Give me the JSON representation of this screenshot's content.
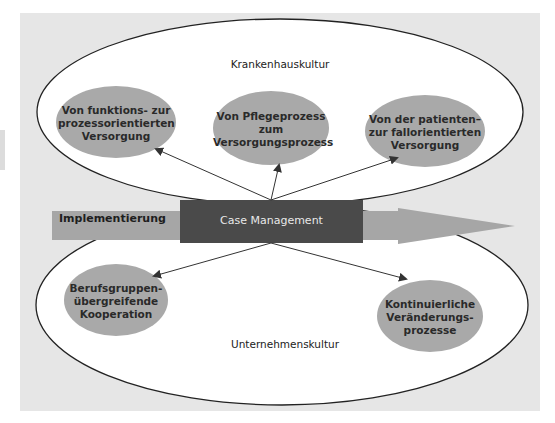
{
  "diagram": {
    "cultures": {
      "top": "Krankenhauskultur",
      "bottom": "Unternehmenskultur"
    },
    "center": {
      "label": "Case Management"
    },
    "flow_arrow": {
      "label": "Implementierung"
    },
    "top_nodes": [
      {
        "lines": [
          "Von funktions- zur",
          "prozessorientierten",
          "Versorgung"
        ]
      },
      {
        "lines": [
          "Von Pflegeprozess",
          "zum",
          "Versorgungsprozess"
        ]
      },
      {
        "lines": [
          "Von der patienten–",
          "zur fallorientierten",
          "Versorgung"
        ]
      }
    ],
    "bottom_nodes": [
      {
        "lines": [
          "Berufsgruppen-",
          "übergreifende",
          "Kooperation"
        ]
      },
      {
        "lines": [
          "Kontinuierliche",
          "Veränderungs-",
          "prozesse"
        ]
      }
    ],
    "colors": {
      "background_panel": "#e6e6e6",
      "ellipse_fill": "#ffffff",
      "ellipse_stroke": "#222222",
      "node_fill": "#a9a9a9",
      "center_box": "#4a4a4a",
      "flow_arrow": "#a6a6a6",
      "connector": "#333333"
    }
  }
}
